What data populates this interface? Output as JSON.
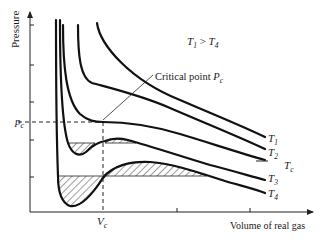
{
  "diagram": {
    "y_axis_label": "Pressure",
    "x_axis_label": "Volume of real gas",
    "condition_text": {
      "T": "T",
      "sub1": "1",
      "gt": " > ",
      "T2": "T",
      "sub4": "4"
    },
    "annotation": {
      "text": "Critical point",
      "symbol": "P",
      "sub": "c"
    },
    "pc_label": {
      "symbol": "p",
      "sub": "c"
    },
    "vc_label": {
      "symbol": "V",
      "sub": "c"
    },
    "curve_labels": [
      {
        "symbol": "T",
        "sub": "1"
      },
      {
        "symbol": "T",
        "sub": "2"
      },
      {
        "symbol": "T",
        "sub": "c"
      },
      {
        "symbol": "T",
        "sub": "3"
      },
      {
        "symbol": "T",
        "sub": "4"
      }
    ],
    "colors": {
      "ink": "#111111",
      "background": "#ffffff"
    }
  }
}
